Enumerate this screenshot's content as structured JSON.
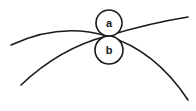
{
  "diagram": {
    "stroke_color": "#1a1a1a",
    "background_color": "#ffffff",
    "circles": [
      {
        "id": "a",
        "label": "a",
        "cx": 109,
        "cy": 23,
        "r": 13
      },
      {
        "id": "b",
        "label": "b",
        "cx": 109,
        "cy": 50,
        "r": 14
      }
    ],
    "curves": [
      {
        "id": "curve-1",
        "path": "M11,45 Q60,22 107,36 Q155,50 188,100"
      },
      {
        "id": "curve-2",
        "path": "M21,85 Q60,48 107,36 Q150,23 188,17"
      }
    ]
  }
}
